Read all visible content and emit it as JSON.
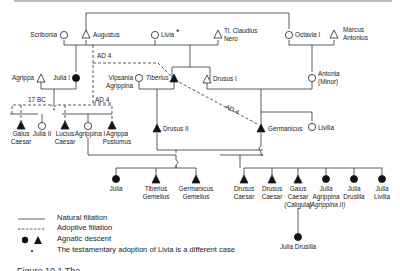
{
  "diagram": {
    "people": {
      "scribonia": "Scribonia",
      "augustus": "Augustus",
      "livia": "Livia",
      "livia_mark": "*",
      "ti_claudius_nero": [
        "Ti. Claudius",
        "Nero"
      ],
      "octavia": "Octavia I",
      "marcus_antonius": [
        "Marcus",
        "Antonius"
      ],
      "agrippa": "Agrippa",
      "julia_i": "Julia I",
      "vipsania": [
        "Vipsania",
        "Agrippina"
      ],
      "tiberius": "Tiberius",
      "drusus_i": "Drusus I",
      "antonia": [
        "Antonia",
        "(Minor)"
      ],
      "gaius_caesar": [
        "Gaius",
        "Caesar"
      ],
      "julia_ii": "Julia II",
      "lucius_caesar": [
        "Lucius",
        "Caesar"
      ],
      "agrippina_i": "Agrippina I",
      "agrippa_postumus": [
        "Agrippa",
        "Postumus"
      ],
      "drusus_ii": "Drusus II",
      "germanicus": "Germanicus",
      "livilla": "Livilla",
      "julia": "Julia",
      "tiberius_gemellus": [
        "Tiberius",
        "Gemellus"
      ],
      "germanicus_gemellus": [
        "Germanicus",
        "Gemellus"
      ],
      "drusus_caesar_1": [
        "Drusus",
        "Caesar"
      ],
      "drusus_caesar_2": [
        "Drusus",
        "Caesar"
      ],
      "gaius_caligula": [
        "Gaius",
        "Caesar",
        "(Caligula)"
      ],
      "julia_agrippina": [
        "Julia",
        "Agrippina",
        "(Agrippina II)"
      ],
      "julia_drusilla": [
        "Julia",
        "Drusilla"
      ],
      "julia_livilla": [
        "Julia",
        "Livilla"
      ],
      "julia_drusilla_child": "Julia Drusilla"
    },
    "annotations": {
      "ad4_top": "AD 4",
      "ad4_left": "AD 4",
      "ad4_diag": "AD 4",
      "bc17": "17 BC"
    }
  },
  "legend": {
    "items": [
      {
        "symbol": "solid-line",
        "label": "Natural filiation"
      },
      {
        "symbol": "dashed-line",
        "label": "Adoptive filiation"
      },
      {
        "symbol": "filled-circle-triangle",
        "label": "Agnatic descent"
      },
      {
        "symbol": "asterisk",
        "label": "The testamentary adoption of Livia is a different case"
      }
    ]
  },
  "caption": {
    "text": "Figure 10.1  The"
  }
}
